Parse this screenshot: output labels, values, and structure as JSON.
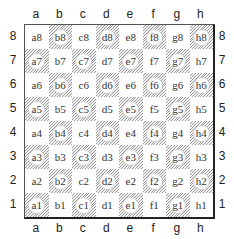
{
  "board": {
    "files": [
      "a",
      "b",
      "c",
      "d",
      "e",
      "f",
      "g",
      "h"
    ],
    "ranks": [
      "8",
      "7",
      "6",
      "5",
      "4",
      "3",
      "2",
      "1"
    ],
    "squares": [
      [
        {
          "label": "a8",
          "dark": false
        },
        {
          "label": "b8",
          "dark": true
        },
        {
          "label": "c8",
          "dark": false
        },
        {
          "label": "d8",
          "dark": true
        },
        {
          "label": "e8",
          "dark": false
        },
        {
          "label": "f8",
          "dark": true
        },
        {
          "label": "g8",
          "dark": false
        },
        {
          "label": "h8",
          "dark": true
        }
      ],
      [
        {
          "label": "a7",
          "dark": true
        },
        {
          "label": "b7",
          "dark": false
        },
        {
          "label": "c7",
          "dark": true
        },
        {
          "label": "d7",
          "dark": false
        },
        {
          "label": "e7",
          "dark": true
        },
        {
          "label": "f7",
          "dark": false
        },
        {
          "label": "g7",
          "dark": true
        },
        {
          "label": "h7",
          "dark": false
        }
      ],
      [
        {
          "label": "a6",
          "dark": false
        },
        {
          "label": "b6",
          "dark": true
        },
        {
          "label": "c6",
          "dark": false
        },
        {
          "label": "d6",
          "dark": true
        },
        {
          "label": "e6",
          "dark": false
        },
        {
          "label": "f6",
          "dark": true
        },
        {
          "label": "g6",
          "dark": false
        },
        {
          "label": "h6",
          "dark": true
        }
      ],
      [
        {
          "label": "a5",
          "dark": true
        },
        {
          "label": "b5",
          "dark": false
        },
        {
          "label": "c5",
          "dark": true
        },
        {
          "label": "d5",
          "dark": false
        },
        {
          "label": "e5",
          "dark": true
        },
        {
          "label": "f5",
          "dark": false
        },
        {
          "label": "g5",
          "dark": true
        },
        {
          "label": "h5",
          "dark": false
        }
      ],
      [
        {
          "label": "a4",
          "dark": false
        },
        {
          "label": "b4",
          "dark": true
        },
        {
          "label": "c4",
          "dark": false
        },
        {
          "label": "d4",
          "dark": true
        },
        {
          "label": "e4",
          "dark": false
        },
        {
          "label": "f4",
          "dark": true
        },
        {
          "label": "g4",
          "dark": false
        },
        {
          "label": "h4",
          "dark": true
        }
      ],
      [
        {
          "label": "a3",
          "dark": true
        },
        {
          "label": "b3",
          "dark": false
        },
        {
          "label": "c3",
          "dark": true
        },
        {
          "label": "d3",
          "dark": false
        },
        {
          "label": "e3",
          "dark": true
        },
        {
          "label": "f3",
          "dark": false
        },
        {
          "label": "g3",
          "dark": true
        },
        {
          "label": "h3",
          "dark": false
        }
      ],
      [
        {
          "label": "a2",
          "dark": false
        },
        {
          "label": "b2",
          "dark": true
        },
        {
          "label": "c2",
          "dark": false
        },
        {
          "label": "d2",
          "dark": true
        },
        {
          "label": "e2",
          "dark": false
        },
        {
          "label": "f2",
          "dark": true
        },
        {
          "label": "g2",
          "dark": false
        },
        {
          "label": "h2",
          "dark": true
        }
      ],
      [
        {
          "label": "a1",
          "dark": true
        },
        {
          "label": "b1",
          "dark": false
        },
        {
          "label": "c1",
          "dark": true
        },
        {
          "label": "d1",
          "dark": false
        },
        {
          "label": "e1",
          "dark": true
        },
        {
          "label": "f1",
          "dark": false
        },
        {
          "label": "g1",
          "dark": true
        },
        {
          "label": "h1",
          "dark": false
        }
      ]
    ]
  },
  "colors": {
    "light_square": "#ffffff",
    "dark_square_hatch": "#9a9a9a",
    "border": "#222222"
  }
}
